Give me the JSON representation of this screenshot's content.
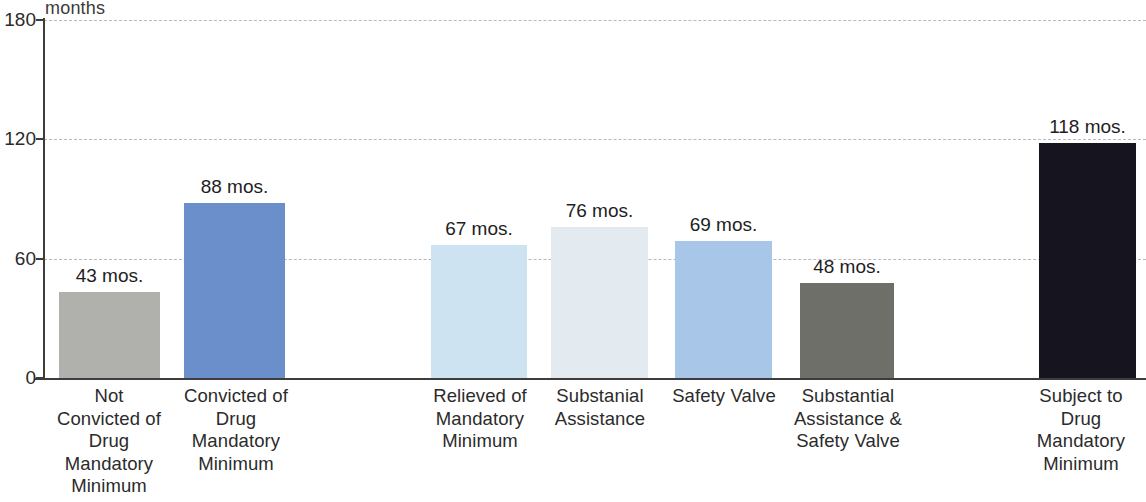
{
  "chart_data": {
    "type": "bar",
    "title": "",
    "subtitle": "",
    "xlabel": "",
    "ylabel": "months",
    "ylim": [
      0,
      180
    ],
    "ytick_labels": [
      "0",
      "60",
      "120",
      "180"
    ],
    "yticks": [
      0,
      60,
      120,
      180
    ],
    "grid": true,
    "legend": "none",
    "unit_suffix": "mos.",
    "categories": [
      "Not Convicted of Drug Mandatory Minimum",
      "Convicted of Drug Mandatory Minimum",
      "Relieved of Mandatory Minimum",
      "Substanial Assistance",
      "Safety Valve",
      "Substantial Assistance & Safety Valve",
      "Subject to Drug Mandatory Minimum"
    ],
    "values": [
      43,
      88,
      67,
      76,
      69,
      48,
      118
    ],
    "data_labels": [
      "43 mos.",
      "88 mos.",
      "67 mos.",
      "76 mos.",
      "69 mos.",
      "48 mos.",
      "118 mos."
    ],
    "colors": [
      "#b0b0ad",
      "#6b8fca",
      "#cee3f2",
      "#e3eaf0",
      "#a8c6e8",
      "#6f6f69",
      "#16141e"
    ],
    "bars": [
      {
        "label_lines": [
          "Not",
          "Convicted of",
          "Drug",
          "Mandatory",
          "Minimum"
        ],
        "value": 43,
        "value_label": "43 mos.",
        "color": "#b0b0ad"
      },
      {
        "label_lines": [
          "Convicted of",
          "Drug",
          "Mandatory",
          "Minimum"
        ],
        "value": 88,
        "value_label": "88 mos.",
        "color": "#6b8fca"
      },
      {
        "label_lines": [
          "Relieved of",
          "Mandatory",
          "Minimum"
        ],
        "value": 67,
        "value_label": "67 mos.",
        "color": "#cee3f2"
      },
      {
        "label_lines": [
          "Substanial",
          "Assistance"
        ],
        "value": 76,
        "value_label": "76 mos.",
        "color": "#e3eaf0"
      },
      {
        "label_lines": [
          "Safety Valve"
        ],
        "value": 69,
        "value_label": "69 mos.",
        "color": "#a8c6e8"
      },
      {
        "label_lines": [
          "Substantial",
          "Assistance &",
          "Safety Valve"
        ],
        "value": 48,
        "value_label": "48 mos.",
        "color": "#6f6f69"
      },
      {
        "label_lines": [
          "Subject to",
          "Drug",
          "Mandatory",
          "Minimum"
        ],
        "value": 118,
        "value_label": "118 mos.",
        "color": "#16141e"
      }
    ]
  },
  "axis": {
    "unit_caption": "months",
    "ticks": [
      {
        "label": "180",
        "value": 180
      },
      {
        "label": "120",
        "value": 120
      },
      {
        "label": "60",
        "value": 60
      },
      {
        "label": "0",
        "value": 0
      }
    ]
  },
  "layout": {
    "bar_geometry": [
      {
        "left": 59,
        "width": 101
      },
      {
        "left": 184,
        "width": 101
      },
      {
        "left": 431,
        "width": 96
      },
      {
        "left": 551,
        "width": 97
      },
      {
        "left": 675,
        "width": 97
      },
      {
        "left": 800,
        "width": 94
      },
      {
        "left": 1039,
        "width": 97
      }
    ],
    "label_geometry": [
      {
        "left": 38,
        "width": 142
      },
      {
        "left": 166,
        "width": 140
      },
      {
        "left": 412,
        "width": 136
      },
      {
        "left": 536,
        "width": 128
      },
      {
        "left": 662,
        "width": 124
      },
      {
        "left": 786,
        "width": 124
      },
      {
        "left": 1016,
        "width": 130
      }
    ]
  }
}
